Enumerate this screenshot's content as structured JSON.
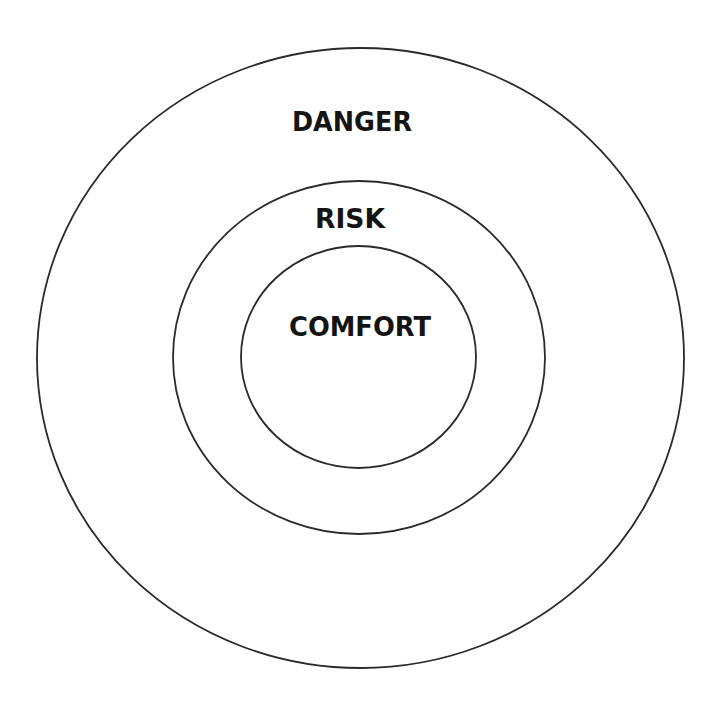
{
  "diagram": {
    "type": "concentric-zones",
    "zones": [
      {
        "label": "DANGER",
        "ring": "outer"
      },
      {
        "label": "RISK",
        "ring": "middle"
      },
      {
        "label": "COMFORT",
        "ring": "inner"
      }
    ],
    "stroke_color": "#2a2a2a",
    "background": "#ffffff"
  }
}
